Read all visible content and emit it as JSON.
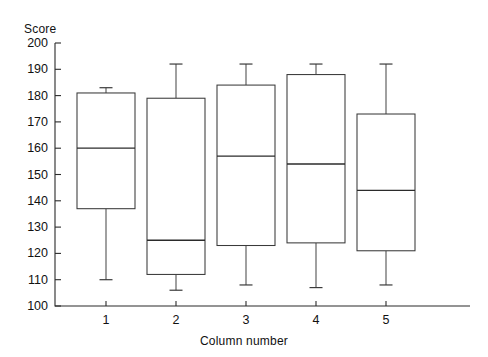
{
  "chart_data": {
    "type": "box",
    "title": "",
    "ylabel": "Score",
    "xlabel": "Column number",
    "categories": [
      "1",
      "2",
      "3",
      "4",
      "5"
    ],
    "ylim": [
      100,
      200
    ],
    "ytick_labels": [
      "200",
      "190",
      "180",
      "170",
      "160",
      "150",
      "140",
      "130",
      "120",
      "110",
      "100"
    ],
    "ytick_values": [
      200,
      190,
      180,
      170,
      160,
      150,
      140,
      130,
      120,
      110,
      100
    ],
    "grid": false,
    "legend": null,
    "boxes": [
      {
        "category": "1",
        "whisker_low": 110,
        "q1": 137,
        "median": 160,
        "q3": 181,
        "whisker_high": 183
      },
      {
        "category": "2",
        "whisker_low": 106,
        "q1": 112,
        "median": 125,
        "q3": 179,
        "whisker_high": 192
      },
      {
        "category": "3",
        "whisker_low": 108,
        "q1": 123,
        "median": 157,
        "q3": 184,
        "whisker_high": 192
      },
      {
        "category": "4",
        "whisker_low": 107,
        "q1": 124,
        "median": 154,
        "q3": 188,
        "whisker_high": 192
      },
      {
        "category": "5",
        "whisker_low": 108,
        "q1": 121,
        "median": 144,
        "q3": 173,
        "whisker_high": 192
      }
    ]
  }
}
